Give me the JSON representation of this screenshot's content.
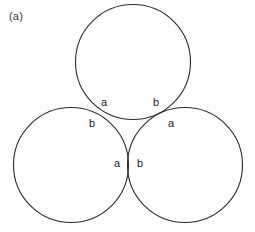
{
  "figure": {
    "caption": "(a)",
    "background_color": "#fdfdfd",
    "stroke_color": "#2b2b2b",
    "label_color": "#1c1c1c",
    "width": 255,
    "height": 232
  },
  "chart_data": {
    "type": "diagram",
    "title": "(a)",
    "subtitle": "",
    "xlabel": "",
    "ylabel": "",
    "grid": false,
    "legend": "none",
    "xlim": [
      0,
      255
    ],
    "ylim": [
      0,
      232
    ],
    "circles": [
      {
        "name": "top-circle",
        "cx": 133,
        "cy": 62,
        "r": 57.5
      },
      {
        "name": "bottom-left-circle",
        "cx": 71,
        "cy": 165,
        "r": 57.5
      },
      {
        "name": "bottom-right-circle",
        "cx": 185,
        "cy": 165,
        "r": 57.5
      }
    ],
    "tangency_points": [
      {
        "name": "upper-left-tangency",
        "x": 102,
        "y": 113,
        "labels": [
          "a",
          "b"
        ]
      },
      {
        "name": "upper-right-tangency",
        "x": 159,
        "y": 113,
        "labels": [
          "b",
          "a"
        ]
      },
      {
        "name": "bottom-tangency",
        "x": 128,
        "y": 165,
        "labels": [
          "a",
          "b"
        ]
      }
    ]
  },
  "labels": {
    "upper_left": {
      "a": "a",
      "b": "b"
    },
    "upper_right": {
      "b": "b",
      "a": "a"
    },
    "bottom": {
      "a": "a",
      "b": "b"
    }
  }
}
